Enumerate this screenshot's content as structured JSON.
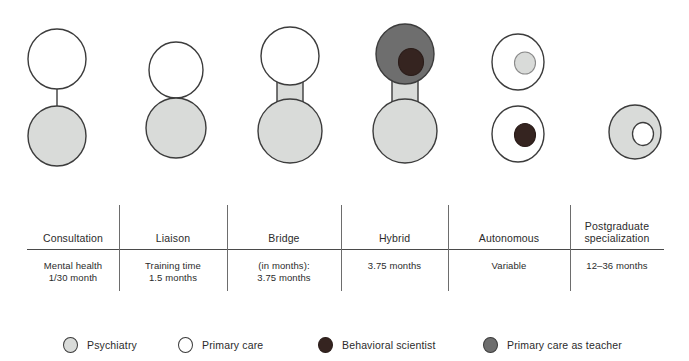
{
  "diagram": {
    "colors": {
      "psychiatry": "#d9dbd9",
      "primary_care": "#ffffff",
      "behavioral_scientist": "#352420",
      "primary_care_as_teacher": "#6e6e6e",
      "outline": "#3c3c3c",
      "text": "#2b2b2b"
    },
    "models": [
      {
        "key": "consultation",
        "name": "Consultation",
        "shape": "two-circles-thin-line",
        "top_circle": "primary-care",
        "bottom_circle": "psychiatry",
        "connector": "thin-line"
      },
      {
        "key": "liaison",
        "name": "Liaison",
        "shape": "two-circles-touching",
        "top_circle": "primary-care",
        "bottom_circle": "psychiatry",
        "connector": "tangent"
      },
      {
        "key": "bridge",
        "name": "Bridge",
        "shape": "two-circles-thick-bar",
        "top_circle": "primary-care",
        "bottom_circle": "psychiatry",
        "connector": "thick-bar"
      },
      {
        "key": "hybrid",
        "name": "Hybrid",
        "shape": "two-circles-thick-bar-with-inner",
        "top_circle": "primary-care-as-teacher",
        "top_inner_circle": "behavioral-scientist",
        "bottom_circle": "psychiatry",
        "connector": "thick-bar"
      },
      {
        "key": "autonomous",
        "name": "Autonomous",
        "shape": "two-separate-circles-with-inner",
        "top_circle": "primary-care",
        "top_inner_circle": "psychiatry",
        "bottom_circle": "primary-care",
        "bottom_inner_circle": "behavioral-scientist",
        "connector": "none"
      },
      {
        "key": "postgraduate",
        "name": "Postgraduate specialization",
        "shape": "single-circle-with-inner",
        "circle": "psychiatry",
        "inner_circle": "primary-care",
        "connector": "none"
      }
    ]
  },
  "table": {
    "columns": [
      {
        "header": "Consultation",
        "value": "Mental health\n1/30 month"
      },
      {
        "header": "Liaison",
        "value": "Training time\n1.5 months"
      },
      {
        "header": "Bridge",
        "value": "(in months):\n3.75 months"
      },
      {
        "header": "Hybrid",
        "value": "3.75  months"
      },
      {
        "header": "Autonomous",
        "value": "Variable"
      },
      {
        "header": "Postgraduate\nspecialization",
        "value": "12–36 months"
      }
    ]
  },
  "legend": {
    "items": [
      {
        "label": "Psychiatry",
        "color": "#d9dbd9",
        "icon": "circle-icon"
      },
      {
        "label": "Primary care",
        "color": "#ffffff",
        "icon": "circle-icon"
      },
      {
        "label": "Behavioral scientist",
        "color": "#352420",
        "icon": "circle-icon"
      },
      {
        "label": "Primary care as teacher",
        "color": "#6e6e6e",
        "icon": "circle-icon"
      }
    ]
  }
}
